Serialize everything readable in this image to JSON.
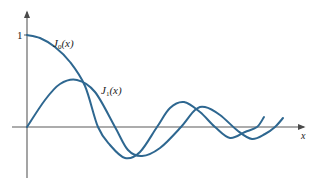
{
  "chart_data": {
    "type": "line",
    "title": "",
    "xlabel": "x",
    "ylabel": "",
    "y_ticks": [
      "1"
    ],
    "grid": false,
    "legend": "inline labels",
    "colors": {
      "curve": "#2e6790",
      "axis": "#5a5a5a"
    },
    "series": [
      {
        "name": "J0(x)",
        "label_main": "J",
        "label_sub": "0",
        "label_arg": "(x)",
        "points_px": [
          [
            27,
            35
          ],
          [
            40,
            38
          ],
          [
            55,
            47
          ],
          [
            70,
            62
          ],
          [
            85,
            86
          ],
          [
            98,
            127
          ],
          [
            110,
            145
          ],
          [
            125,
            158
          ],
          [
            140,
            152
          ],
          [
            157,
            127
          ],
          [
            170,
            108
          ],
          [
            184,
            102
          ],
          [
            200,
            112
          ],
          [
            215,
            127
          ],
          [
            230,
            138
          ],
          [
            245,
            132
          ],
          [
            257,
            127
          ],
          [
            264,
            117
          ]
        ],
        "approx_values": [
          [
            0,
            1.0
          ],
          [
            2.405,
            0
          ],
          [
            3.83,
            -0.4
          ],
          [
            5.52,
            0
          ],
          [
            7.02,
            0.3
          ],
          [
            8.65,
            0
          ],
          [
            10.17,
            -0.25
          ],
          [
            11.79,
            0
          ]
        ]
      },
      {
        "name": "J1(x)",
        "label_main": "J",
        "label_sub": "1",
        "label_arg": "(x)",
        "points_px": [
          [
            27,
            127
          ],
          [
            45,
            100
          ],
          [
            60,
            84
          ],
          [
            77,
            80
          ],
          [
            95,
            92
          ],
          [
            115,
            127
          ],
          [
            128,
            150
          ],
          [
            142,
            156
          ],
          [
            160,
            148
          ],
          [
            181,
            127
          ],
          [
            195,
            110
          ],
          [
            205,
            107
          ],
          [
            220,
            115
          ],
          [
            238,
            131
          ],
          [
            252,
            139
          ],
          [
            265,
            134
          ],
          [
            275,
            127
          ],
          [
            283,
            118
          ]
        ],
        "approx_values": [
          [
            0,
            0
          ],
          [
            1.84,
            0.58
          ],
          [
            3.83,
            0
          ],
          [
            5.33,
            -0.35
          ],
          [
            7.02,
            0
          ],
          [
            8.54,
            0.27
          ],
          [
            10.17,
            0
          ],
          [
            11.71,
            -0.23
          ]
        ]
      }
    ],
    "axes": {
      "origin_px": [
        27,
        127
      ],
      "x_axis_px": [
        12,
        304
      ],
      "y_axis_px": [
        14,
        178
      ],
      "y_unit_px": 92
    }
  }
}
